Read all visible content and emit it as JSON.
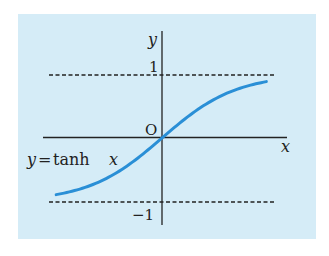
{
  "figure": {
    "background_color": "#d5ecf7",
    "curve_color": "#2a8fd6",
    "axis_color": "#222222",
    "labels": {
      "y_axis": "y",
      "x_axis": "x",
      "origin": "O",
      "upper_asymptote": "1",
      "lower_asymptote": "−1",
      "curve_label_lhs": "y",
      "curve_label_eq": "=",
      "curve_label_fn": "tanh",
      "curve_label_var": "x"
    }
  },
  "chart_data": {
    "type": "line",
    "title": "",
    "function": "y = tanh x",
    "xlabel": "x",
    "ylabel": "y",
    "asymptotes": [
      1,
      -1
    ],
    "asymptote_style": "dashed",
    "x_range": [
      -1.43,
      1.41
    ],
    "ylim": [
      -1.2,
      1.4
    ],
    "grid": false,
    "series": [
      {
        "name": "y = tanh x",
        "x": [
          -1.43,
          -1.2,
          -1.0,
          -0.8,
          -0.6,
          -0.4,
          -0.2,
          0,
          0.2,
          0.4,
          0.6,
          0.8,
          1.0,
          1.2,
          1.41
        ],
        "y": [
          -0.892,
          -0.834,
          -0.762,
          -0.664,
          -0.537,
          -0.38,
          -0.197,
          0,
          0.197,
          0.38,
          0.537,
          0.664,
          0.762,
          0.834,
          0.887
        ]
      }
    ],
    "annotations": [
      "O",
      "1",
      "−1",
      "y = tanh x"
    ]
  }
}
